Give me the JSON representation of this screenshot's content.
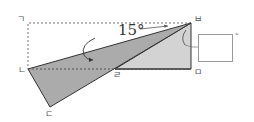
{
  "diagram": {
    "type": "folded-rectangle-geometry",
    "vertices": {
      "top_left": {
        "label": "ㄱ",
        "x": 28,
        "y": 23
      },
      "left": {
        "label": "ㄴ",
        "x": 28,
        "y": 69
      },
      "bottom": {
        "label": "ㄷ",
        "x": 50,
        "y": 107
      },
      "middle": {
        "label": "ㄹ",
        "x": 115,
        "y": 69
      },
      "bottom_right": {
        "label": "ㅁ",
        "x": 191,
        "y": 69
      },
      "top_right": {
        "label": "ㅂ",
        "x": 191,
        "y": 23
      }
    },
    "angle_label": "15°",
    "answer_box": {
      "value": "",
      "unit": "°"
    },
    "colors": {
      "folded_triangle": "#a9a9a9",
      "right_triangle": "#d0d0d0",
      "stroke": "#333333",
      "dashed": "#777777"
    }
  }
}
